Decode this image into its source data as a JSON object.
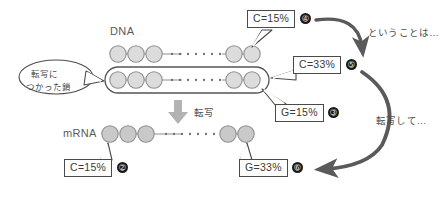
{
  "diagram": {
    "title_dna": "DNA",
    "title_mrna": "mRNA",
    "transcribe_arrow_label": "転写",
    "speech_bubble": {
      "line1": "転写に",
      "line2": "つかった鎖"
    },
    "annotations": [
      {
        "name": "toiukotowa",
        "text": "ということは…"
      },
      {
        "name": "tensha-shite",
        "text": "転写して…"
      }
    ],
    "value_boxes": [
      {
        "id": "box-c15-dna",
        "text": "C=15%",
        "badge": "➃"
      },
      {
        "id": "box-c33-dna",
        "text": "C=33%",
        "badge": "➄"
      },
      {
        "id": "box-g15-dna",
        "text": "G=15%",
        "badge": "➂"
      },
      {
        "id": "box-c15-mrna",
        "text": "C=15%",
        "badge": "➁"
      },
      {
        "id": "box-g33-mrna",
        "text": "G=33%",
        "badge": "➅"
      }
    ],
    "colors": {
      "node_fill": "#dcdcdc",
      "node_stroke": "#8f8f8f",
      "mrna_node_fill": "#c9c9c9",
      "arrow_gray": "#b3b3b3",
      "curve_arrow": "#5a5a5a",
      "box_border": "#4a4a4a",
      "badge_bg": "#1a1a1a",
      "text": "#4d4d4d"
    }
  }
}
